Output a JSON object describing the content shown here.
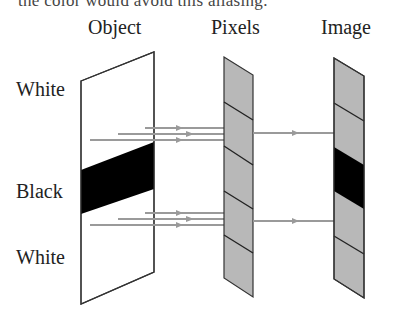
{
  "header": {
    "cut_text": "the color would avoid this aliasing."
  },
  "columns": {
    "object": "Object",
    "pixels": "Pixels",
    "image": "Image"
  },
  "rows": {
    "top": "White",
    "middle": "Black",
    "bottom": "White"
  },
  "colors": {
    "outline": "#333333",
    "black_band": "#000000",
    "pixel_fill": "#b8b8b8",
    "ray": "#9a9a9a",
    "background": "#ffffff"
  }
}
